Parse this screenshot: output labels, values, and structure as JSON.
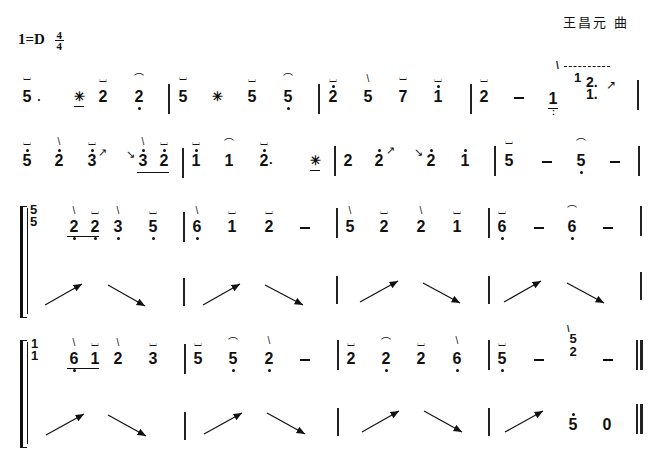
{
  "header": {
    "composer": "王昌元 曲",
    "key": "1=D",
    "time_sig_top": "4",
    "time_sig_bottom": "4"
  },
  "marks": {
    "pluck": "⌴",
    "tremolo": "﹏",
    "arc": "⌒",
    "stroke": "\\",
    "star": "✳",
    "dash": "–",
    "slide_up": "↗",
    "slide_down": "↘"
  },
  "systems": [
    {
      "line": 1,
      "measures": [
        [
          "5.",
          "✳",
          "2",
          "2"
        ],
        [
          "5",
          "✳",
          "5",
          "5"
        ],
        [
          "2",
          "5",
          "7",
          "1"
        ],
        [
          "2",
          "–",
          "1 / 1 2. 1."
        ]
      ]
    },
    {
      "line": 2,
      "measures": [
        [
          "5",
          "2",
          "3↗",
          "↘3 2"
        ],
        [
          "1",
          "1",
          "2.",
          "✳"
        ],
        [
          "2",
          "2↗",
          "↘2",
          "1"
        ],
        [
          "5",
          "–",
          "5",
          "–"
        ]
      ]
    },
    {
      "line": 3,
      "upper": [
        [
          "5/5",
          "2 2",
          "3",
          "5"
        ],
        [
          "6",
          "1",
          "2",
          "–"
        ],
        [
          "5",
          "2",
          "2",
          "1"
        ],
        [
          "6",
          "–",
          "6",
          "–"
        ]
      ],
      "lower": [
        [
          "↗",
          "↘"
        ],
        [
          "↗",
          "↘"
        ],
        [
          "↗",
          "↘"
        ],
        [
          "↗",
          "↘"
        ]
      ]
    },
    {
      "line": 4,
      "upper": [
        [
          "1/1",
          "6 1",
          "2",
          "3"
        ],
        [
          "5",
          "5",
          "2",
          "–"
        ],
        [
          "2",
          "2",
          "2",
          "6"
        ],
        [
          "5",
          "–",
          "5/2",
          "–"
        ]
      ],
      "lower": [
        [
          "↗",
          "↘"
        ],
        [
          "↗",
          "↘"
        ],
        [
          "↗",
          "↘"
        ],
        [
          "↗",
          "5",
          "0"
        ]
      ]
    }
  ],
  "text": {
    "n5": "5",
    "n2": "2",
    "n7": "7",
    "n1": "1",
    "n3": "3",
    "n6": "6",
    "n0": "0",
    "dot": ".",
    "dot2": "2.",
    "dot1": "1."
  }
}
